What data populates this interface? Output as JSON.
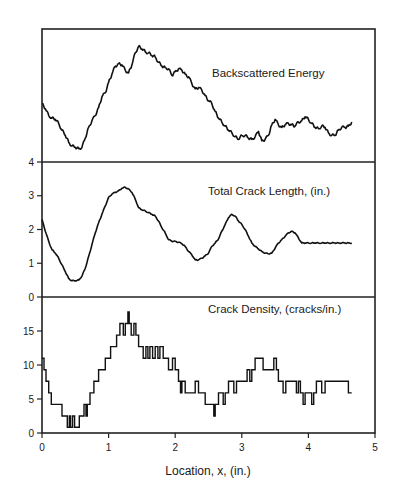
{
  "chart_data": [
    {
      "type": "line",
      "title": "Backscattered Energy",
      "xlabel": "Location, x, (in.)",
      "ylabel": "",
      "xlim": [
        0,
        5
      ],
      "ylim": [
        0,
        100
      ],
      "y_units": "arbitrary (no tick labels shown; relative height 0=panel bottom, 100=panel top)",
      "y_ticks": [],
      "grid": false,
      "x": [
        0.0,
        0.05,
        0.1,
        0.15,
        0.2,
        0.25,
        0.3,
        0.35,
        0.4,
        0.45,
        0.5,
        0.55,
        0.6,
        0.65,
        0.7,
        0.75,
        0.8,
        0.85,
        0.9,
        0.95,
        1.0,
        1.05,
        1.1,
        1.15,
        1.2,
        1.25,
        1.3,
        1.35,
        1.4,
        1.45,
        1.5,
        1.55,
        1.6,
        1.65,
        1.7,
        1.75,
        1.8,
        1.85,
        1.9,
        1.95,
        2.0,
        2.05,
        2.1,
        2.15,
        2.2,
        2.25,
        2.3,
        2.35,
        2.4,
        2.45,
        2.5,
        2.55,
        2.6,
        2.65,
        2.7,
        2.75,
        2.8,
        2.85,
        2.9,
        2.95,
        3.0,
        3.05,
        3.1,
        3.15,
        3.2,
        3.25,
        3.3,
        3.35,
        3.4,
        3.45,
        3.5,
        3.55,
        3.6,
        3.65,
        3.7,
        3.75,
        3.8,
        3.85,
        3.9,
        3.95,
        4.0,
        4.05,
        4.1,
        4.15,
        4.2,
        4.25,
        4.3,
        4.35,
        4.4,
        4.45,
        4.5,
        4.55,
        4.6,
        4.65
      ],
      "values": [
        44,
        40,
        35,
        33,
        32,
        29,
        24,
        20,
        15,
        12,
        11,
        10,
        11,
        18,
        26,
        31,
        35,
        41,
        49,
        52,
        60,
        66,
        72,
        74,
        73,
        69,
        67,
        73,
        82,
        87,
        85,
        83,
        82,
        80,
        79,
        75,
        72,
        71,
        70,
        65,
        68,
        70,
        69,
        66,
        64,
        59,
        55,
        56,
        54,
        50,
        46,
        44,
        38,
        33,
        30,
        27,
        24,
        22,
        19,
        17,
        20,
        20,
        18,
        17,
        19,
        23,
        16,
        17,
        20,
        28,
        32,
        28,
        26,
        28,
        29,
        28,
        27,
        30,
        31,
        34,
        32,
        29,
        26,
        25,
        27,
        26,
        22,
        20,
        20,
        24,
        26,
        26,
        27,
        30
      ],
      "panel": "top"
    },
    {
      "type": "line",
      "title": "Total Crack Length, (in.)",
      "xlabel": "Location, x, (in.)",
      "ylabel": "",
      "xlim": [
        0,
        5
      ],
      "ylim": [
        0,
        4
      ],
      "y_ticks": [
        0,
        1,
        2,
        3,
        4
      ],
      "grid": false,
      "x": [
        0.0,
        0.05,
        0.1,
        0.15,
        0.2,
        0.25,
        0.3,
        0.35,
        0.4,
        0.45,
        0.5,
        0.55,
        0.6,
        0.65,
        0.7,
        0.75,
        0.8,
        0.85,
        0.9,
        0.95,
        1.0,
        1.05,
        1.1,
        1.15,
        1.2,
        1.25,
        1.3,
        1.35,
        1.4,
        1.45,
        1.5,
        1.55,
        1.6,
        1.65,
        1.7,
        1.75,
        1.8,
        1.85,
        1.9,
        1.95,
        2.0,
        2.05,
        2.1,
        2.15,
        2.2,
        2.25,
        2.3,
        2.35,
        2.4,
        2.45,
        2.5,
        2.55,
        2.6,
        2.65,
        2.7,
        2.75,
        2.8,
        2.85,
        2.9,
        2.95,
        3.0,
        3.05,
        3.1,
        3.15,
        3.2,
        3.25,
        3.3,
        3.35,
        3.4,
        3.45,
        3.5,
        3.55,
        3.6,
        3.65,
        3.7,
        3.75,
        3.8,
        3.85,
        3.9,
        3.95,
        4.0,
        4.05,
        4.1,
        4.15,
        4.2,
        4.25,
        4.3,
        4.35,
        4.4,
        4.45,
        4.5,
        4.55,
        4.6,
        4.65
      ],
      "values": [
        2.3,
        1.95,
        1.65,
        1.4,
        1.3,
        1.15,
        0.95,
        0.75,
        0.55,
        0.48,
        0.48,
        0.5,
        0.62,
        0.85,
        1.2,
        1.55,
        1.9,
        2.2,
        2.45,
        2.7,
        2.95,
        3.05,
        3.1,
        3.15,
        3.22,
        3.25,
        3.2,
        3.1,
        2.9,
        2.65,
        2.58,
        2.55,
        2.5,
        2.45,
        2.4,
        2.25,
        2.05,
        1.9,
        1.7,
        1.65,
        1.65,
        1.62,
        1.58,
        1.5,
        1.35,
        1.25,
        1.1,
        1.1,
        1.15,
        1.22,
        1.3,
        1.5,
        1.6,
        1.72,
        1.95,
        2.15,
        2.35,
        2.45,
        2.4,
        2.25,
        2.15,
        2.0,
        1.8,
        1.6,
        1.5,
        1.42,
        1.35,
        1.3,
        1.28,
        1.3,
        1.45,
        1.6,
        1.7,
        1.8,
        1.9,
        1.95,
        1.9,
        1.75,
        1.6,
        1.6,
        1.6,
        1.6,
        1.6,
        1.6,
        1.6,
        1.6,
        1.6,
        1.6,
        1.6,
        1.6,
        1.6,
        1.6,
        1.6,
        1.6
      ],
      "panel": "middle"
    },
    {
      "type": "line",
      "step": true,
      "title": "Crack Density, (cracks/in.)",
      "xlabel": "Location, x, (in.)",
      "ylabel": "",
      "xlim": [
        0,
        5
      ],
      "ylim": [
        0,
        20
      ],
      "y_ticks": [
        0,
        5,
        10,
        15
      ],
      "x_ticks": [
        0,
        1,
        2,
        3,
        4,
        5
      ],
      "grid": false,
      "x": [
        0.0,
        0.03,
        0.06,
        0.1,
        0.14,
        0.3,
        0.38,
        0.41,
        0.43,
        0.46,
        0.49,
        0.56,
        0.63,
        0.66,
        0.68,
        0.72,
        0.78,
        0.85,
        0.95,
        1.03,
        1.12,
        1.17,
        1.22,
        1.25,
        1.29,
        1.31,
        1.34,
        1.38,
        1.41,
        1.45,
        1.52,
        1.56,
        1.59,
        1.62,
        1.66,
        1.7,
        1.74,
        1.77,
        1.82,
        1.9,
        1.96,
        2.0,
        2.05,
        2.08,
        2.1,
        2.15,
        2.3,
        2.35,
        2.45,
        2.58,
        2.6,
        2.65,
        2.72,
        2.75,
        2.8,
        2.88,
        2.92,
        3.08,
        3.12,
        3.15,
        3.2,
        3.32,
        3.48,
        3.52,
        3.55,
        3.62,
        3.66,
        3.82,
        3.85,
        3.88,
        3.92,
        3.95,
        4.05,
        4.08,
        4.12,
        4.2,
        4.25,
        4.32,
        4.38,
        4.42,
        4.52,
        4.58,
        4.6,
        4.65
      ],
      "values": [
        11.0,
        9.3,
        7.6,
        5.9,
        4.2,
        2.5,
        0.85,
        2.5,
        0.85,
        2.5,
        0.85,
        2.5,
        4.2,
        2.5,
        4.2,
        5.9,
        7.6,
        9.3,
        11.0,
        12.7,
        14.4,
        16.1,
        14.4,
        16.1,
        17.8,
        16.1,
        14.4,
        16.1,
        14.4,
        12.7,
        11.0,
        12.7,
        11.0,
        12.7,
        11.0,
        12.7,
        11.0,
        12.7,
        11.0,
        9.3,
        11.0,
        9.3,
        7.6,
        5.9,
        7.6,
        5.9,
        7.6,
        5.9,
        4.2,
        2.5,
        4.2,
        5.9,
        4.2,
        5.9,
        7.6,
        5.9,
        7.6,
        9.3,
        7.6,
        9.3,
        11.0,
        9.3,
        11.0,
        9.3,
        7.6,
        5.9,
        7.6,
        5.9,
        7.6,
        5.9,
        4.2,
        5.9,
        4.2,
        5.9,
        7.6,
        5.9,
        7.6,
        7.6,
        7.6,
        7.6,
        7.6,
        7.6,
        5.9,
        5.9
      ],
      "panel": "bottom"
    }
  ],
  "figure": {
    "xlabel": "Location, x, (in.)",
    "x_tick_labels": [
      "0",
      "1",
      "2",
      "3",
      "4",
      "5"
    ],
    "panels": [
      {
        "title": "Backscattered Energy",
        "y_tick_labels": []
      },
      {
        "title": "Total Crack Length, (in.)",
        "y_tick_labels": [
          "4",
          "3",
          "2",
          "1",
          "0"
        ]
      },
      {
        "title": "Crack Density, (cracks/in.)",
        "y_tick_labels": [
          "15",
          "10",
          "5",
          "0"
        ]
      }
    ],
    "line_color": "#111111",
    "frame_color": "#222222"
  }
}
